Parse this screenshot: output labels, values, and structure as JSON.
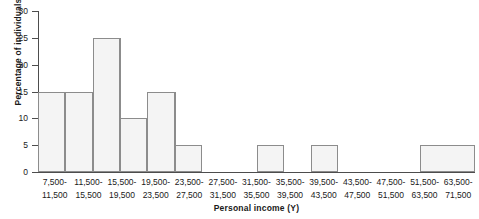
{
  "chart_data": {
    "type": "bar",
    "title": "",
    "subtitle": "",
    "xlabel": "Personal income (Y)",
    "ylabel": "Percentage of individuals",
    "ylim": [
      0,
      30
    ],
    "yticks": [
      0,
      5,
      10,
      15,
      20,
      25,
      30
    ],
    "grid": false,
    "legend": null,
    "bin_edges": [
      7500,
      11500,
      15500,
      19500,
      23500,
      27500,
      31500,
      35500,
      39500,
      43500,
      47500,
      51500,
      63500,
      71500
    ],
    "categories": [
      "7,500-11,500",
      "11,500-15,500",
      "15,500-19,500",
      "19,500-23,500",
      "23,500-27,500",
      "27,500-31,500",
      "31,500-35,500",
      "35,500-39,500",
      "39,500-43,500",
      "43,500-47,500",
      "47,500-51,500",
      "51,500-63,500",
      "63,500-71,500"
    ],
    "values": [
      15,
      15,
      25,
      10,
      15,
      5,
      0,
      0,
      5,
      0,
      5,
      0,
      5
    ],
    "tick_labels": [
      {
        "line1": "7,500-",
        "line2": "11,500"
      },
      {
        "line1": "11,500-",
        "line2": "15,500"
      },
      {
        "line1": "15,500-",
        "line2": "19,500"
      },
      {
        "line1": "19,500-",
        "line2": "23,500"
      },
      {
        "line1": "23,500-",
        "line2": "27,500"
      },
      {
        "line1": "27,500-",
        "line2": "31,500"
      },
      {
        "line1": "31,500-",
        "line2": "35,500"
      },
      {
        "line1": "35,500-",
        "line2": "39,500"
      },
      {
        "line1": "39,500-",
        "line2": "43,500"
      },
      {
        "line1": "43,500-",
        "line2": "47,500"
      },
      {
        "line1": "47,500-",
        "line2": "51,500"
      },
      {
        "line1": "51,500-",
        "line2": "63,500"
      },
      {
        "line1": "63,500-",
        "line2": "71,500"
      }
    ],
    "colors": {
      "bar_fill": "#f4f4f4",
      "bar_border": "#8c8c8c",
      "axis": "#4d4d4d",
      "text": "#1a1a1a",
      "background": "#ffffff"
    }
  }
}
